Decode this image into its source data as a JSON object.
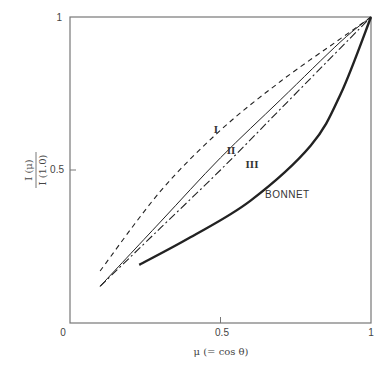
{
  "chart_data": {
    "type": "line",
    "title": "",
    "xlabel": "μ (= cos θ)",
    "ylabel": "I (μ) / I (1.0)",
    "xlim": [
      0,
      1
    ],
    "ylim": [
      0,
      1
    ],
    "x_ticks": [
      "0",
      "0.5",
      "1"
    ],
    "y_ticks": [
      "0.5",
      "1"
    ],
    "grid": false,
    "legend": "inline labels",
    "series": [
      {
        "name": "I",
        "style": "dashed",
        "x": [
          0.1,
          0.3,
          0.5,
          0.7,
          0.9,
          1.0
        ],
        "y": [
          0.17,
          0.43,
          0.63,
          0.79,
          0.93,
          1.0
        ]
      },
      {
        "name": "II",
        "style": "solid-thin",
        "x": [
          0.1,
          0.3,
          0.5,
          0.7,
          0.9,
          1.0
        ],
        "y": [
          0.12,
          0.33,
          0.54,
          0.73,
          0.92,
          1.0
        ]
      },
      {
        "name": "III",
        "style": "dash-dot",
        "x": [
          0.1,
          0.3,
          0.5,
          0.7,
          0.9,
          1.0
        ],
        "y": [
          0.12,
          0.31,
          0.5,
          0.7,
          0.9,
          1.0
        ]
      },
      {
        "name": "BONNET",
        "style": "solid-thick",
        "x": [
          0.23,
          0.4,
          0.6,
          0.8,
          0.9,
          1.0
        ],
        "y": [
          0.19,
          0.28,
          0.4,
          0.58,
          0.75,
          1.0
        ]
      }
    ]
  },
  "labels": {
    "x_tick_0": "0",
    "x_tick_05": "0.5",
    "x_tick_1": "1",
    "y_tick_05": "0.5",
    "y_tick_1": "1",
    "xlabel": "μ (= cos θ)",
    "ylabel_num": "I (μ)",
    "ylabel_den": "I (1.0)",
    "curve_I": "I",
    "curve_II": "II",
    "curve_III": "III",
    "curve_bonnet": "BONNET"
  },
  "colors": {
    "axis": "#666666",
    "curve": "#222222"
  }
}
